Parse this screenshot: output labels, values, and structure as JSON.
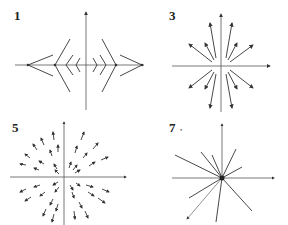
{
  "figure": {
    "panels": [
      {
        "id": "panel-1",
        "label": "1",
        "description": "Vector field with chevron/wedge shapes opening outward along x-axis",
        "x_axis_label": "x",
        "y_axis_label": "y"
      },
      {
        "id": "panel-3",
        "label": "3",
        "description": "Radial arrows pointing outward from origin (source)",
        "x_axis_label": "x",
        "y_axis_label": "y"
      },
      {
        "id": "panel-5",
        "label": "5",
        "description": "Grid of short arrows pointing radially outward",
        "x_axis_label": "x",
        "y_axis_label": "y"
      },
      {
        "id": "panel-7",
        "label": "7",
        "description": "3D star of lines radiating through origin with x, y, z axes",
        "x_axis_label": "y",
        "y_axis_label": "z",
        "z_axis_label": "x",
        "extra_mark": ","
      }
    ]
  },
  "colors": {
    "line": "#333333",
    "axis": "#555555",
    "background": "#ffffff"
  }
}
